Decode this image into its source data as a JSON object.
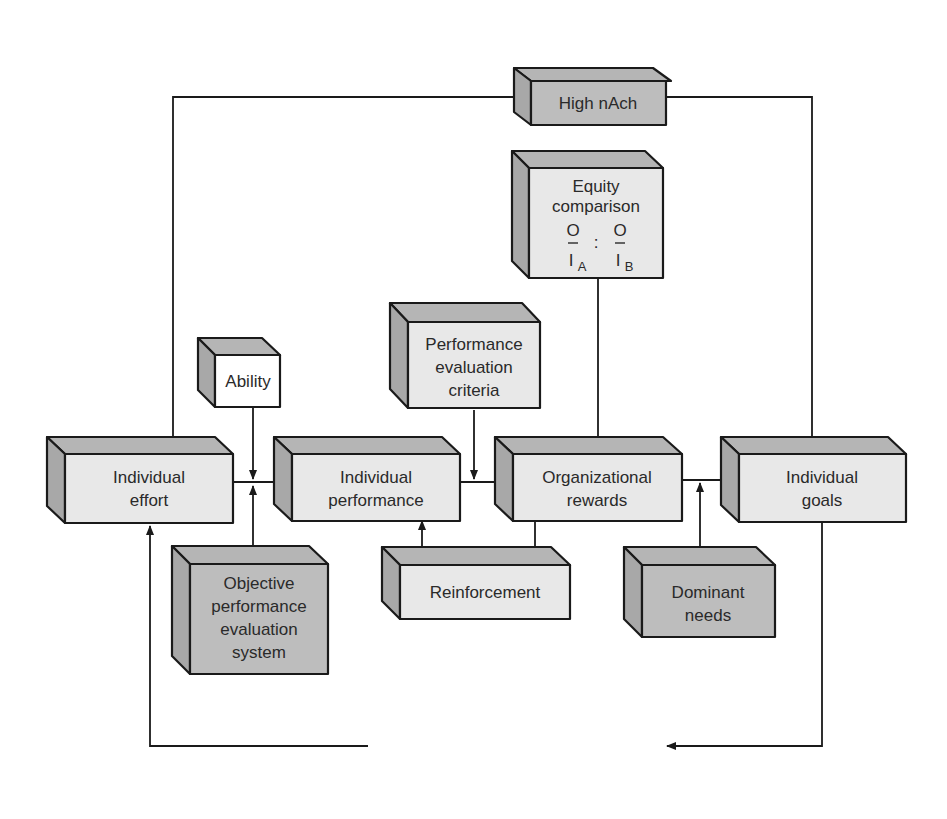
{
  "diagram": {
    "title": "",
    "colors": {
      "light_box": "#e8e8e8",
      "dark_box": "#bdbdbd",
      "white_box": "#ffffff",
      "line": "#1a1a1a"
    },
    "nodes": [
      {
        "id": "high_nach",
        "lines": [
          "High nAch"
        ],
        "shade": "dark"
      },
      {
        "id": "equity_comparison",
        "lines": [
          "Equity",
          "comparison"
        ],
        "formula": {
          "left_num": "O",
          "left_den": "I",
          "left_sub": "A",
          "sep": ":",
          "right_num": "O",
          "right_den": "I",
          "right_sub": "B"
        },
        "shade": "light"
      },
      {
        "id": "ability",
        "lines": [
          "Ability"
        ],
        "shade": "white"
      },
      {
        "id": "performance_evaluation_criteria",
        "lines": [
          "Performance",
          "evaluation",
          "criteria"
        ],
        "shade": "light"
      },
      {
        "id": "individual_effort",
        "lines": [
          "Individual",
          "effort"
        ],
        "shade": "light"
      },
      {
        "id": "individual_performance",
        "lines": [
          "Individual",
          "performance"
        ],
        "shade": "light"
      },
      {
        "id": "organizational_rewards",
        "lines": [
          "Organizational",
          "rewards"
        ],
        "shade": "light"
      },
      {
        "id": "individual_goals",
        "lines": [
          "Individual",
          "goals"
        ],
        "shade": "light"
      },
      {
        "id": "objective_performance_evaluation_system",
        "lines": [
          "Objective",
          "performance",
          "evaluation",
          "system"
        ],
        "shade": "dark"
      },
      {
        "id": "reinforcement",
        "lines": [
          "Reinforcement"
        ],
        "shade": "light"
      },
      {
        "id": "dominant_needs",
        "lines": [
          "Dominant",
          "needs"
        ],
        "shade": "dark"
      },
      {
        "id": "goals_direct_behaviour",
        "lines": [
          "Goals direct behaviour"
        ],
        "shade": "light"
      }
    ],
    "edges": [
      {
        "from": "individual_effort",
        "to": "high_nach"
      },
      {
        "from": "high_nach",
        "to": "individual_goals"
      },
      {
        "from": "individual_effort",
        "to": "individual_performance"
      },
      {
        "from": "ability",
        "to": "individual_effort->individual_performance"
      },
      {
        "from": "objective_performance_evaluation_system",
        "to": "individual_effort->individual_performance"
      },
      {
        "from": "individual_performance",
        "to": "organizational_rewards"
      },
      {
        "from": "performance_evaluation_criteria",
        "to": "individual_performance->organizational_rewards"
      },
      {
        "from": "organizational_rewards",
        "to": "equity_comparison",
        "bidirectional": true
      },
      {
        "from": "organizational_rewards",
        "to": "reinforcement"
      },
      {
        "from": "reinforcement",
        "to": "individual_performance"
      },
      {
        "from": "organizational_rewards",
        "to": "individual_goals"
      },
      {
        "from": "dominant_needs",
        "to": "organizational_rewards->individual_goals"
      },
      {
        "from": "individual_goals",
        "to": "goals_direct_behaviour"
      },
      {
        "from": "goals_direct_behaviour",
        "to": "individual_effort"
      }
    ]
  }
}
